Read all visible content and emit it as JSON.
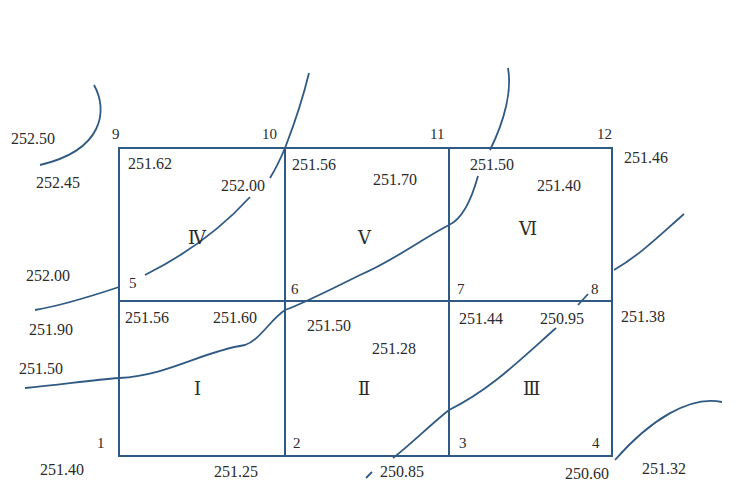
{
  "diagram": {
    "type": "square grid leveling / earthwork contour diagram",
    "line_color": "#2f5a84",
    "grid": {
      "rows": 2,
      "cols": 3,
      "point_numbers": {
        "p1": "1",
        "p2": "2",
        "p3": "3",
        "p4": "4",
        "p5": "5",
        "p6": "6",
        "p7": "7",
        "p8": "8",
        "p9": "9",
        "p10": "10",
        "p11": "11",
        "p12": "12"
      },
      "cells": {
        "c1": "Ⅰ",
        "c2": "Ⅱ",
        "c3": "Ⅲ",
        "c4": "Ⅳ",
        "c5": "Ⅴ",
        "c6": "Ⅵ"
      }
    },
    "elevations": {
      "p9_corner": "251.62",
      "p10_cell4": "252.00",
      "p10_cell5": "251.56",
      "cell5_top": "251.70",
      "p11_cell6": "251.50",
      "cell6_top": "251.40",
      "p12_outer": "251.46",
      "p5_cell1": "251.56",
      "p6_cell1": "251.60",
      "p6_cell2": "251.50",
      "cell2_top": "251.28",
      "p7_cell3": "251.44",
      "p8_cell3": "250.95",
      "p8_outer": "251.38",
      "p1_outer": "251.40",
      "p2_outer": "251.25",
      "p3_outer": "250.85",
      "p4_outer": "250.60"
    },
    "contours": {
      "c25250": "252.50",
      "c25245": "252.45",
      "c25200": "252.00",
      "c25190": "251.90",
      "c25150": "251.50",
      "c25132": "251.32"
    }
  }
}
